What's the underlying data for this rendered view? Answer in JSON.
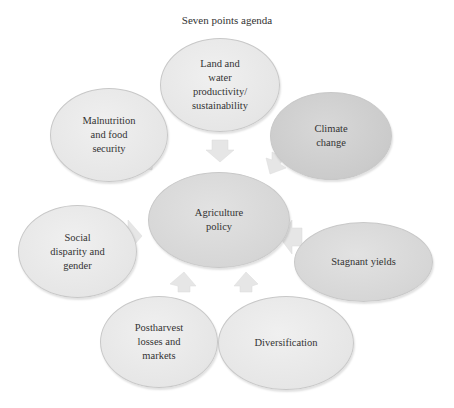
{
  "title": "Seven points agenda",
  "center": {
    "label": "Agriculture policy",
    "lines": [
      "Agriculture",
      "policy"
    ]
  },
  "nodes": [
    {
      "id": "land-water",
      "lines": [
        "Land and",
        "water",
        "productivity/",
        "sustainability"
      ]
    },
    {
      "id": "climate",
      "lines": [
        "Climate",
        "change"
      ]
    },
    {
      "id": "stagnant",
      "lines": [
        "Stagnant yields"
      ]
    },
    {
      "id": "diversification",
      "lines": [
        "Diversification"
      ]
    },
    {
      "id": "postharvest",
      "lines": [
        "Postharvest",
        "losses and",
        "markets"
      ]
    },
    {
      "id": "social",
      "lines": [
        "Social",
        "disparity and",
        "gender"
      ]
    },
    {
      "id": "malnutrition",
      "lines": [
        "Malnutrition",
        "and food",
        "security"
      ]
    }
  ],
  "colors": {
    "arrow": "#e4e4e4",
    "node_border": "#c8c8c8",
    "text": "#333333"
  }
}
